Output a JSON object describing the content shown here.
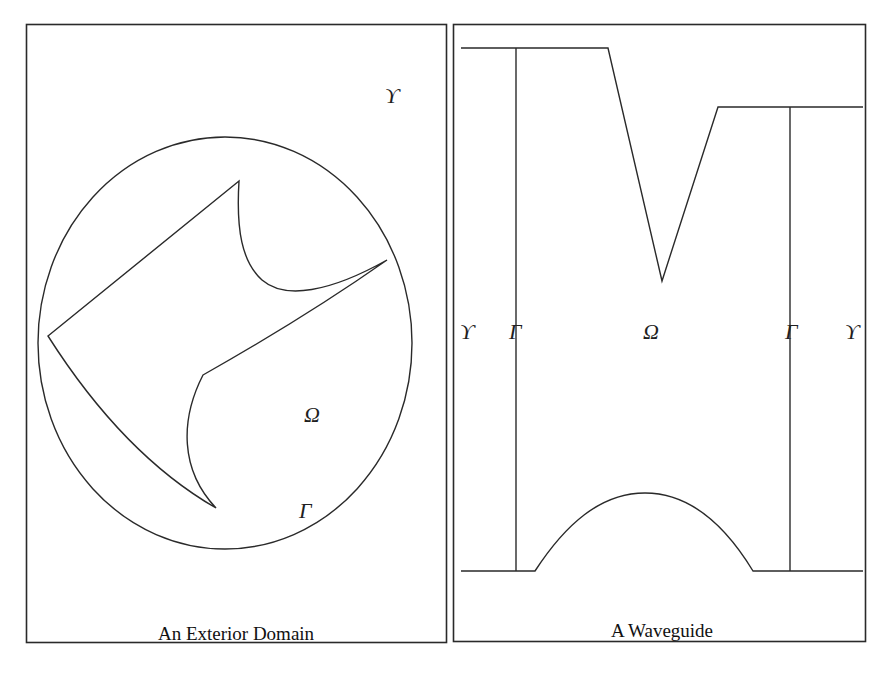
{
  "figure": {
    "panels": [
      {
        "id": "exterior-domain",
        "caption": "An Exterior Domain",
        "labels": {
          "upsilon": "ϒ",
          "omega": "Ω",
          "gamma": "Γ"
        },
        "shapes": {
          "artificial_boundary": "circle",
          "obstacle": "curved polygon with three spikes"
        }
      },
      {
        "id": "waveguide",
        "caption": "A Waveguide",
        "labels": {
          "upsilon_left": "ϒ",
          "gamma_left": "Γ",
          "omega": "Ω",
          "gamma_right": "Γ",
          "upsilon_right": "ϒ"
        },
        "shapes": {
          "top_wall": "step with V-notch",
          "bottom_wall": "flat with central bump",
          "artificial_boundaries": "two vertical lines"
        }
      }
    ]
  }
}
